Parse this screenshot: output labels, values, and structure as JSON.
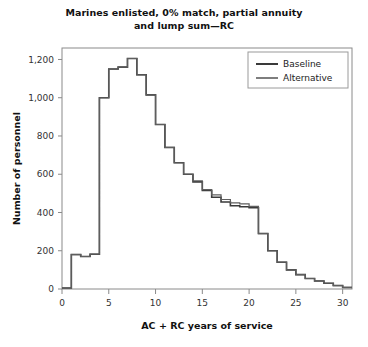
{
  "chart_data": {
    "type": "line",
    "title": "Marines enlisted, 0% match, partial annuity and lump sum—RC",
    "title_lines": [
      "Marines enlisted, 0% match, partial annuity",
      "and lump sum—RC"
    ],
    "xlabel": "AC + RC years of service",
    "ylabel": "Number of personnel",
    "xlim": [
      0,
      31
    ],
    "ylim": [
      0,
      1260
    ],
    "xticks": [
      0,
      5,
      10,
      15,
      20,
      25,
      30
    ],
    "xtick_labels": [
      "0",
      "5",
      "10",
      "15",
      "20",
      "25",
      "30"
    ],
    "yticks": [
      0,
      200,
      400,
      600,
      800,
      1000,
      1200
    ],
    "ytick_labels": [
      "0",
      "200",
      "400",
      "600",
      "800",
      "1,000",
      "1,200"
    ],
    "grid": false,
    "step_style": "post",
    "legend_position": "top-right",
    "x": [
      0,
      1,
      2,
      3,
      4,
      5,
      6,
      7,
      8,
      9,
      10,
      11,
      12,
      13,
      14,
      15,
      16,
      17,
      18,
      19,
      20,
      21,
      22,
      23,
      24,
      25,
      26,
      27,
      28,
      29,
      30
    ],
    "series": [
      {
        "name": "Baseline",
        "color": "#3a3a3a",
        "width": 1.6,
        "values": [
          5,
          180,
          170,
          182,
          1000,
          1150,
          1160,
          1205,
          1120,
          1015,
          860,
          740,
          660,
          600,
          560,
          515,
          480,
          455,
          435,
          430,
          425,
          290,
          200,
          140,
          100,
          75,
          55,
          42,
          30,
          18,
          8
        ]
      },
      {
        "name": "Alternative",
        "color": "#5e5e5e",
        "width": 1.2,
        "values": [
          5,
          180,
          170,
          182,
          1000,
          1150,
          1160,
          1205,
          1120,
          1015,
          860,
          740,
          660,
          600,
          565,
          520,
          492,
          468,
          450,
          445,
          432,
          290,
          200,
          140,
          100,
          75,
          55,
          42,
          30,
          18,
          8
        ]
      }
    ],
    "legend_entries": [
      "Baseline",
      "Alternative"
    ]
  },
  "plot_geometry": {
    "left": 62,
    "right": 352,
    "top": 48,
    "bottom": 289
  },
  "legend": {
    "x": 248,
    "y": 52,
    "width": 100,
    "height": 36
  }
}
